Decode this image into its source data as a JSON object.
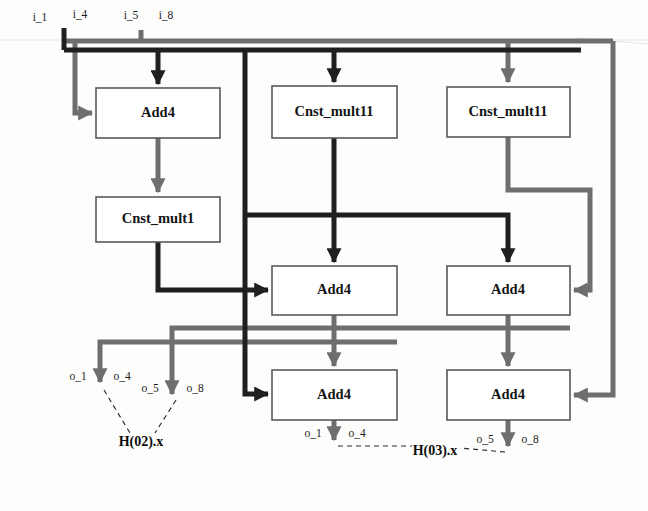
{
  "diagram": {
    "colors": {
      "wire_dark": "#1f1f1f",
      "wire_gray": "#6e6e6e",
      "block_border": "#59595a",
      "block_fill": "#ffffff",
      "background": "#fdfdfc",
      "text": "#141414"
    },
    "blocks": [
      {
        "id": "add4_a",
        "label": "Add4",
        "x": 96,
        "y": 88,
        "w": 124,
        "h": 50
      },
      {
        "id": "cnst_mult1",
        "label": "Cnst_mult1",
        "x": 96,
        "y": 197,
        "w": 124,
        "h": 45
      },
      {
        "id": "cnst_mult11_m",
        "label": "Cnst_mult11",
        "x": 272,
        "y": 86,
        "w": 125,
        "h": 52
      },
      {
        "id": "cnst_mult11_r",
        "label": "Cnst_mult11",
        "x": 447,
        "y": 87,
        "w": 123,
        "h": 50
      },
      {
        "id": "add4_ml",
        "label": "Add4",
        "x": 272,
        "y": 266,
        "w": 125,
        "h": 49
      },
      {
        "id": "add4_mr",
        "label": "Add4",
        "x": 447,
        "y": 266,
        "w": 123,
        "h": 49
      },
      {
        "id": "add4_bl",
        "label": "Add4",
        "x": 272,
        "y": 370,
        "w": 125,
        "h": 50
      },
      {
        "id": "add4_br",
        "label": "Add4",
        "x": 447,
        "y": 370,
        "w": 123,
        "h": 50
      }
    ],
    "input_labels": [
      {
        "id": "i_1",
        "text": "i_1",
        "x": 40,
        "y": 18
      },
      {
        "id": "i_4",
        "text": "i_4",
        "x": 80,
        "y": 15
      },
      {
        "id": "i_5",
        "text": "i_5",
        "x": 131,
        "y": 16
      },
      {
        "id": "i_8",
        "text": "i_8",
        "x": 166,
        "y": 16
      }
    ],
    "output_labels": [
      {
        "id": "o_1_left",
        "text": "o_1",
        "x": 78,
        "y": 377
      },
      {
        "id": "o_4_left",
        "text": "o_4",
        "x": 122,
        "y": 377
      },
      {
        "id": "o_5_left",
        "text": "o_5",
        "x": 150,
        "y": 389
      },
      {
        "id": "o_8_left",
        "text": "o_8",
        "x": 195,
        "y": 389
      },
      {
        "id": "o_1_right",
        "text": "o_1",
        "x": 313,
        "y": 434
      },
      {
        "id": "o_4_right",
        "text": "o_4",
        "x": 357,
        "y": 434
      },
      {
        "id": "o_5_right",
        "text": "o_5",
        "x": 485,
        "y": 440
      },
      {
        "id": "o_8_right",
        "text": "o_8",
        "x": 530,
        "y": 440
      }
    ],
    "group_labels": [
      {
        "id": "h02",
        "text": "H(02).x",
        "x": 141,
        "y": 443
      },
      {
        "id": "h03",
        "text": "H(03).x",
        "x": 435,
        "y": 452
      }
    ]
  }
}
